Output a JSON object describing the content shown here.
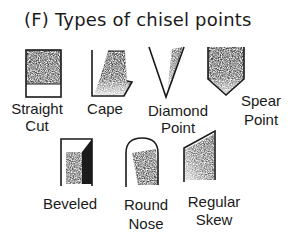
{
  "figure": {
    "title": "(F) Types of chisel points",
    "items": [
      {
        "name": "straight-cut",
        "label_lines": [
          "Straight",
          "Cut"
        ]
      },
      {
        "name": "cape",
        "label_lines": [
          "Cape"
        ]
      },
      {
        "name": "diamond-point",
        "label_lines": [
          "Diamond",
          "Point"
        ]
      },
      {
        "name": "spear-point",
        "label_lines": [
          "Spear",
          "Point"
        ]
      },
      {
        "name": "beveled",
        "label_lines": [
          "Beveled"
        ]
      },
      {
        "name": "round-nose",
        "label_lines": [
          "Round",
          "Nose"
        ]
      },
      {
        "name": "regular-skew",
        "label_lines": [
          "Regular",
          "Skew"
        ]
      }
    ],
    "colors": {
      "ink": "#1a1a1a",
      "shade_dark": "#2a2a2a",
      "shade_light": "#d8d8d8"
    }
  }
}
